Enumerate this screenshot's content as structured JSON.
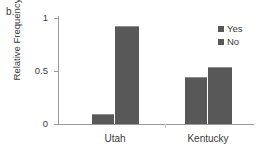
{
  "figure": {
    "panel_label": "b.",
    "bar_color": "#585858",
    "axis_color": "#9a9a9a",
    "text_color": "#3b3b3b"
  },
  "chart_data": {
    "type": "bar",
    "title": "",
    "subtitle": "",
    "xlabel": "",
    "ylabel": "Relative Frequency",
    "categories": [
      "Utah",
      "Kentucky"
    ],
    "series": [
      {
        "name": "Yes",
        "values": [
          0.09,
          0.44
        ],
        "color": "#585858"
      },
      {
        "name": "No",
        "values": [
          0.92,
          0.54
        ],
        "color": "#585858"
      }
    ],
    "ylim": [
      0,
      1
    ],
    "yticks": [
      0,
      0.5,
      1
    ],
    "ytick_labels": [
      "0",
      "0.5",
      "1"
    ],
    "grid": false,
    "legend_position": "top-right",
    "legend_entries": [
      "Yes",
      "No"
    ],
    "annotations": [
      "b."
    ]
  }
}
